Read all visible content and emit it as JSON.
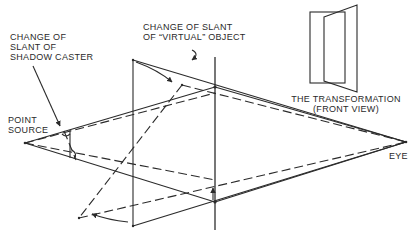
{
  "labels": {
    "shadow_caster": "CHANGE OF\nSLANT OF\nSHADOW CASTER",
    "virtual_object": "CHANGE OF SLANT\nOF “VIRTUAL” OBJECT",
    "point_source": "POINT\nSOURCE",
    "transformation": "THE TRANSFORMATION\n(FRONT VIEW)",
    "eye": "EYE"
  },
  "colors": {
    "line": "#2b2b2b",
    "background": "#ffffff"
  }
}
